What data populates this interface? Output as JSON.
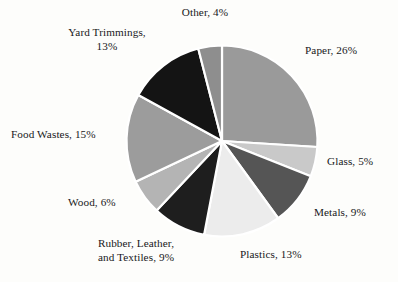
{
  "chart_data": {
    "type": "pie",
    "title": "",
    "subtitle": "",
    "xlabel": "",
    "ylabel": "",
    "legend_position": "none",
    "grid": false,
    "units": "percent",
    "start_angle_deg": 0,
    "direction": "clockwise",
    "categories": [
      "Paper",
      "Glass",
      "Metals",
      "Plastics",
      "Rubber, Leather, and Textiles",
      "Wood",
      "Food Wastes",
      "Yard Trimmings",
      "Other"
    ],
    "values": [
      26,
      5,
      9,
      13,
      9,
      6,
      15,
      13,
      4
    ],
    "colors": [
      "#9a9a9a",
      "#c9c9c9",
      "#555555",
      "#ececec",
      "#1e1e1e",
      "#b4b4b4",
      "#9c9c9c",
      "#141414",
      "#8e8e8e"
    ],
    "slice_separator_color": "#ffffff",
    "background_color": "#fdfdfb",
    "slices": [
      {
        "label": "Paper, 26%",
        "name": "Paper",
        "value": 26,
        "color": "#9a9a9a"
      },
      {
        "label": "Glass, 5%",
        "name": "Glass",
        "value": 5,
        "color": "#c9c9c9"
      },
      {
        "label": "Metals, 9%",
        "name": "Metals",
        "value": 9,
        "color": "#555555"
      },
      {
        "label": "Plastics, 13%",
        "name": "Plastics",
        "value": 13,
        "color": "#ececec"
      },
      {
        "label": "Rubber, Leather,\nand Textiles, 9%",
        "name": "Rubber, Leather, and Textiles",
        "value": 9,
        "color": "#1e1e1e"
      },
      {
        "label": "Wood, 6%",
        "name": "Wood",
        "value": 6,
        "color": "#b4b4b4"
      },
      {
        "label": "Food Wastes, 15%",
        "name": "Food Wastes",
        "value": 15,
        "color": "#9c9c9c"
      },
      {
        "label": "Yard Trimmings,\n13%",
        "name": "Yard Trimmings",
        "value": 13,
        "color": "#141414"
      },
      {
        "label": "Other, 4%",
        "name": "Other",
        "value": 4,
        "color": "#8e8e8e"
      }
    ]
  },
  "labels": {
    "other": "Other, 4%",
    "yard_trimmings": "Yard Trimmings,\n13%",
    "paper": "Paper, 26%",
    "glass": "Glass, 5%",
    "metals": "Metals, 9%",
    "plastics": "Plastics, 13%",
    "rubber": "Rubber, Leather,\nand Textiles, 9%",
    "wood": "Wood, 6%",
    "food_wastes": "Food Wastes, 15%"
  }
}
